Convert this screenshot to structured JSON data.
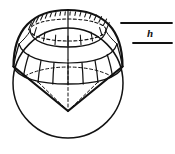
{
  "figure": {
    "annotations": {
      "h_label": "h"
    },
    "colors": {
      "stroke": "#121212",
      "background": "#ffffff"
    },
    "geometry": {
      "sphere": {
        "cx": 68,
        "cy": 83,
        "r": 55
      },
      "cap": {
        "top_apex_x": 68,
        "top_apex_y": 10,
        "rim_ellipse_cx": 68,
        "rim_ellipse_cy": 55,
        "rim_rx": 55,
        "rim_ry": 14
      },
      "inner_dashed_ellipse": {
        "cx": 68,
        "cy": 27,
        "rx": 39,
        "ry": 11
      },
      "cone_apex": {
        "x": 68,
        "y": 83
      },
      "meridian_count": 9,
      "hatch_tick_count": 22
    },
    "leader_lines": [
      {
        "name": "upper-leader-line",
        "x1": 121,
        "y1": 23,
        "x2": 172,
        "y2": 23
      },
      {
        "name": "lower-leader-line",
        "x1": 133,
        "y1": 43,
        "x2": 172,
        "y2": 43
      }
    ]
  }
}
